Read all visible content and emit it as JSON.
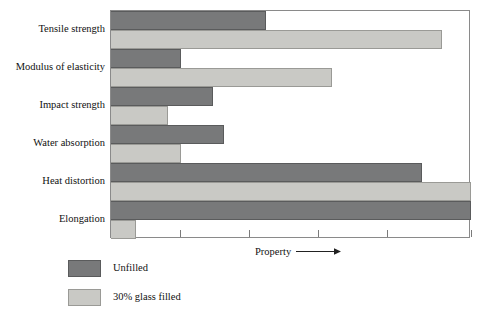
{
  "chart_data": {
    "type": "bar",
    "orientation": "horizontal",
    "title": "",
    "subtitle": "",
    "xlabel": "Property",
    "ylabel": "",
    "xlabel_arrow": "→",
    "grid": false,
    "legend_position": "below-left",
    "xlim": [
      0,
      100
    ],
    "xticks": [
      0,
      19.2,
      38.3,
      57.5,
      76.7,
      100
    ],
    "xticklabels": [
      "",
      "",
      "",
      "",
      "",
      ""
    ],
    "categories": [
      "Tensile strength",
      "Modulus of elasticity",
      "Impact strength",
      "Water absorption",
      "Heat distortion",
      "Elongation"
    ],
    "series": [
      {
        "name": "Unfilled",
        "color": "#78797a",
        "values": [
          43.1,
          19.4,
          28.3,
          31.4,
          86.4,
          100.0
        ]
      },
      {
        "name": "30% glass filled",
        "color": "#c9c9c5",
        "values": [
          91.9,
          61.4,
          15.8,
          19.4,
          100.0,
          7.0
        ]
      }
    ],
    "legend": [
      {
        "label": "Unfilled",
        "color": "#78797a"
      },
      {
        "label": "30% glass filled",
        "color": "#c9c9c5"
      }
    ]
  },
  "colors": {
    "unfilled": "#78797a",
    "glass_filled": "#c9c9c5",
    "frame": "#8a8a8a",
    "background": "#ffffff",
    "text": "#111111"
  }
}
